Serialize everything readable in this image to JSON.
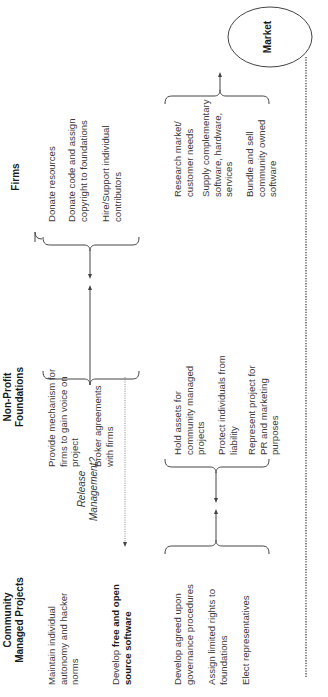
{
  "columns": [
    {
      "id": "community",
      "header": [
        "Community",
        "Managed Projects"
      ],
      "top_items": [
        "Maintain individual autonomy and hacker norms"
      ],
      "develop": {
        "prefix": "Develop ",
        "bold": "free and open source software"
      },
      "bottom_items": [
        "Develop agreed upon governance procedures",
        "Assign limited rights to foundations",
        "Elect representatives"
      ]
    },
    {
      "id": "nonprofit",
      "header": [
        "Non-Profit",
        "Foundations"
      ],
      "top_items": [
        "Provide mechanism for firms to gain voice on project",
        "Broker agreements with firms"
      ],
      "bottom_items": [
        "Hold assets for community managed projects",
        "Protect individuals from liability",
        "Represent project for PR and marketing purposes"
      ]
    },
    {
      "id": "firms",
      "header": [
        "Firms"
      ],
      "top_items": [
        "Donate resources",
        "Donate code and assign copyright to foundations",
        "Hire/Support individual contributors"
      ],
      "bottom_items": [
        "Research market/ customer needs",
        "Supply complementary software, hardware, services",
        "Bundle and sell community owned software"
      ]
    }
  ],
  "release_label": [
    "Release",
    "Management?"
  ],
  "market_label": "Market",
  "colors": {
    "text": "#3a3a3a",
    "line": "#333333",
    "background": "#ffffff"
  }
}
